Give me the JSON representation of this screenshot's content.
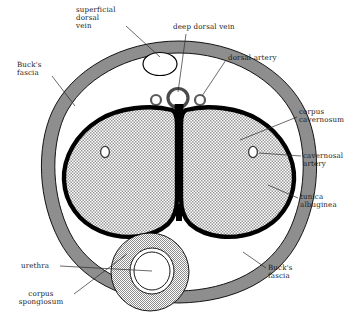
{
  "diagram": {
    "view": "transverse anatomical cross-section",
    "background_color": "#ffffff",
    "ink_color": "#000000",
    "fascia_fill": "#8e8e8e",
    "cavernosum_fill": "#b8b8b8",
    "spongiosum_fill": "#c2c2c2",
    "tunica_color": "#000000",
    "lumen_fill": "#ffffff"
  },
  "labels": [
    {
      "id": "superficial-dorsal-vein",
      "text": "superficial\ndorsal\nvein",
      "align": "left",
      "x": 76,
      "y": 6,
      "w": 62
    },
    {
      "id": "deep-dorsal-vein",
      "text": "deep dorsal vein",
      "align": "left",
      "x": 173,
      "y": 23,
      "w": 70
    },
    {
      "id": "dorsal-artery",
      "text": "dorsal artery",
      "align": "left",
      "x": 228,
      "y": 54,
      "w": 60
    },
    {
      "id": "bucks-fascia-top",
      "text": "Buck's\nfascia",
      "align": "left",
      "x": 17,
      "y": 61,
      "w": 40
    },
    {
      "id": "corpus-cavernosum",
      "text": "corpus\ncavernosum",
      "align": "left",
      "x": 299,
      "y": 108,
      "w": 58
    },
    {
      "id": "cavernosal-artery",
      "text": "cavernosal\nartery",
      "align": "left",
      "x": 303,
      "y": 152,
      "w": 54
    },
    {
      "id": "tunica-albuginea",
      "text": "tunica\nalbuginea",
      "align": "left",
      "x": 300,
      "y": 193,
      "w": 54
    },
    {
      "id": "bucks-fascia-bottom",
      "text": "Buck's\nfascia",
      "align": "left",
      "x": 268,
      "y": 264,
      "w": 40
    },
    {
      "id": "urethra",
      "text": "urethra",
      "align": "left",
      "x": 21,
      "y": 262,
      "w": 38
    },
    {
      "id": "corpus-spongiosum",
      "text": "corpus\nspongiosum",
      "align": "center",
      "x": 11,
      "y": 290,
      "w": 62
    }
  ],
  "structures": [
    {
      "id": "bucks-fascia-ring",
      "name": "Buck's fascia"
    },
    {
      "id": "corpus-cavernosum-left",
      "name": "corpus cavernosum (left)"
    },
    {
      "id": "corpus-cavernosum-right",
      "name": "corpus cavernosum (right)"
    },
    {
      "id": "tunica-albuginea",
      "name": "tunica albuginea"
    },
    {
      "id": "septum",
      "name": "intercavernous septum"
    },
    {
      "id": "corpus-spongiosum",
      "name": "corpus spongiosum"
    },
    {
      "id": "urethra-lumen",
      "name": "urethra"
    },
    {
      "id": "superficial-dorsal-vein",
      "name": "superficial dorsal vein"
    },
    {
      "id": "deep-dorsal-vein",
      "name": "deep dorsal vein"
    },
    {
      "id": "dorsal-artery-left",
      "name": "dorsal artery (left)"
    },
    {
      "id": "dorsal-artery-right",
      "name": "dorsal artery (right)"
    },
    {
      "id": "cavernosal-artery-left",
      "name": "cavernosal artery (left)"
    },
    {
      "id": "cavernosal-artery-right",
      "name": "cavernosal artery (right)"
    }
  ]
}
